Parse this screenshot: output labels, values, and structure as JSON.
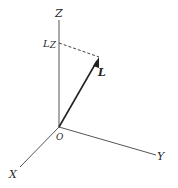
{
  "diagram": {
    "title": "",
    "axes": {
      "z": {
        "label": "Z"
      },
      "y": {
        "label": "Y"
      },
      "x": {
        "label": "X"
      },
      "origin": {
        "label": "O"
      }
    },
    "vector": {
      "label": "L"
    },
    "projection": {
      "label": "L",
      "subscript": "Z"
    },
    "colors": {
      "line": "#3a3a3a",
      "text": "#2a2a2a",
      "background": "#ffffff"
    }
  }
}
